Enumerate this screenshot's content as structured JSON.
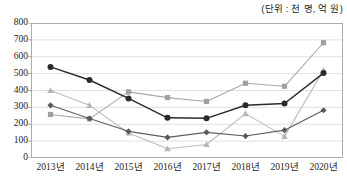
{
  "unit_note": "(단위 : 천 명, 억 원)",
  "chart_data": {
    "type": "line",
    "title": "",
    "subtitle": "",
    "xlabel": "",
    "ylabel": "",
    "unit_note": "(단위 : 천 명, 억 원)",
    "categories": [
      "2013년",
      "2014년",
      "2015년",
      "2016년",
      "2017년",
      "2018년",
      "2019년",
      "2020년"
    ],
    "x_tick_labels": [
      "2013년",
      "2014년",
      "2015년",
      "2016년",
      "2017년",
      "2018년",
      "2019년",
      "2020년"
    ],
    "y_tick_labels": [
      "0",
      "100",
      "200",
      "300",
      "400",
      "500",
      "600",
      "700",
      "800"
    ],
    "y_ticks": [
      0,
      100,
      200,
      300,
      400,
      500,
      600,
      700,
      800
    ],
    "ylim": [
      0,
      800
    ],
    "grid": true,
    "grid_axis": "y",
    "legend": false,
    "legend_position": "none",
    "series": [
      {
        "name": "series-1",
        "marker": "circle",
        "color": "#2b2b2b",
        "line_color": "#2b2b2b",
        "values": [
          540,
          462,
          353,
          238,
          235,
          313,
          323,
          503
        ]
      },
      {
        "name": "series-2",
        "marker": "square",
        "color": "#a0a0a0",
        "line_color": "#a8a8a8",
        "values": [
          258,
          232,
          392,
          358,
          335,
          443,
          425,
          683
        ]
      },
      {
        "name": "series-3",
        "marker": "triangle",
        "color": "#b5b5b5",
        "line_color": "#bcbcbc",
        "values": [
          400,
          312,
          148,
          55,
          80,
          263,
          128,
          520
        ]
      },
      {
        "name": "series-4",
        "marker": "diamond",
        "color": "#595959",
        "line_color": "#5e5e5e",
        "values": [
          312,
          234,
          158,
          122,
          152,
          130,
          165,
          283
        ]
      }
    ]
  }
}
